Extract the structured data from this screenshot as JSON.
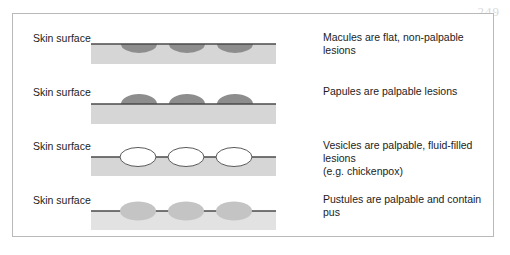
{
  "figure": {
    "page_number": "249",
    "skin_surface_label": "Skin surface",
    "colors": {
      "panel_border": "#b9b9b9",
      "dermis_band": "#d6d6d6",
      "skin_line": "#4a4a4a",
      "macule_fill": "#8d8d8d",
      "papule_fill": "#8d8d8d",
      "vesicle_fill": "#ffffff",
      "vesicle_stroke": "#5a5a5a",
      "pustule_fill": "#c4c4c4",
      "page_number_color": "#dadada"
    },
    "rows": [
      {
        "id": "macules",
        "skin_label": "Skin surface",
        "caption_line1": "Macules are flat, non-palpable lesions",
        "caption_line2": "",
        "lesion_type": "macule",
        "lesion_count": 3
      },
      {
        "id": "papules",
        "skin_label": "Skin surface",
        "caption_line1": "Papules are palpable lesions",
        "caption_line2": "",
        "lesion_type": "papule",
        "lesion_count": 3
      },
      {
        "id": "vesicles",
        "skin_label": "Skin surface",
        "caption_line1": "Vesicles are palpable, fluid-filled lesions",
        "caption_line2": "(e.g. chickenpox)",
        "lesion_type": "vesicle",
        "lesion_count": 3
      },
      {
        "id": "pustules",
        "skin_label": "Skin surface",
        "caption_line1": "Pustules are palpable and contain pus",
        "caption_line2": "",
        "lesion_type": "pustule",
        "lesion_count": 3
      }
    ]
  }
}
